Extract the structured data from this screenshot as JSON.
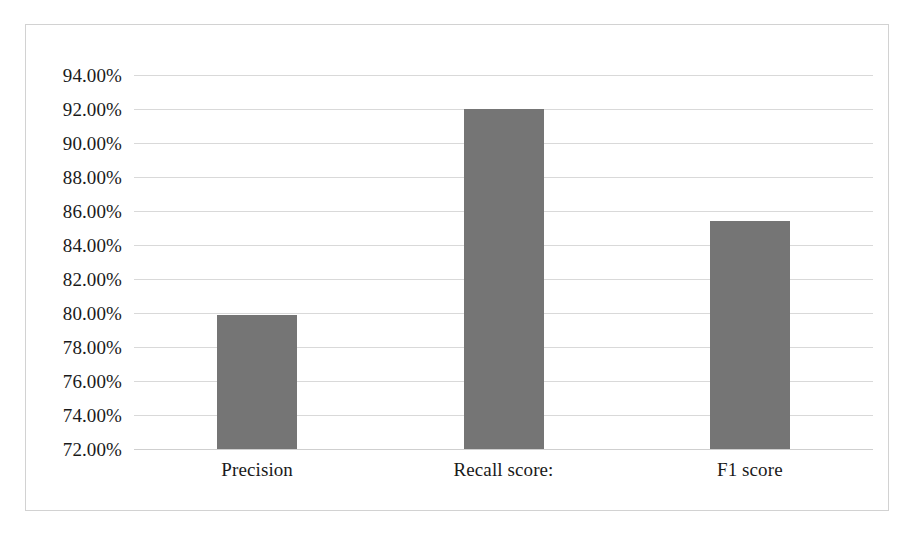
{
  "chart_data": {
    "type": "bar",
    "title": "",
    "subtitle": "",
    "xlabel": "",
    "ylabel": "",
    "categories": [
      "Precision",
      "Recall score:",
      "F1 score"
    ],
    "values": [
      79.9,
      92.0,
      85.4
    ],
    "value_labels": [
      "79.90%",
      "92.00%",
      "85.40%"
    ],
    "series": [
      {
        "name": "",
        "values": [
          79.9,
          92.0,
          85.4
        ]
      }
    ],
    "ylim": [
      72,
      94
    ],
    "ytick_values": [
      94,
      92,
      90,
      88,
      86,
      84,
      82,
      80,
      78,
      76,
      74,
      72
    ],
    "ytick_labels": [
      "94.00%",
      "92.00%",
      "90.00%",
      "88.00%",
      "86.00%",
      "84.00%",
      "82.00%",
      "80.00%",
      "78.00%",
      "76.00%",
      "74.00%",
      "72.00%"
    ],
    "grid": true,
    "grid_axis": "y",
    "legend": false,
    "legend_position": "none",
    "annotations": [],
    "colors": {
      "bar_fill": "#757575",
      "gridline": "#d9d9d9",
      "border": "#d2d2d2",
      "background": "#ffffff",
      "text": "#1a1a1a"
    }
  }
}
